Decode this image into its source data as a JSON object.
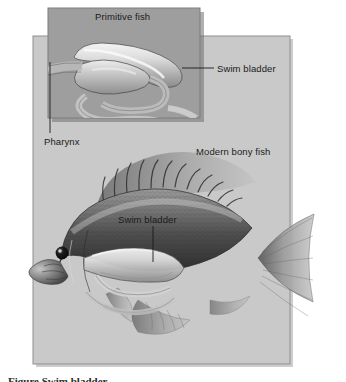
{
  "figure": {
    "kind": "scientific-illustration",
    "palette": {
      "page_background": "#ffffff",
      "main_panel_fill": "#c9c9c9",
      "inset_panel_fill": "#9e9e9e",
      "panel_border": "#8a8a8a",
      "shadow": "#6f6f6f",
      "label_text": "#1a1a1a",
      "leader_line": "#1a1a1a",
      "fish_dark": "#3a3a3a",
      "fish_mid": "#6e6e6e",
      "fish_light": "#cfcfcf",
      "organ_highlight": "#efefef",
      "eye": "#141414"
    }
  },
  "panels": {
    "inset": {
      "name": "primitive-fish-inset",
      "title": "Primitive fish",
      "x": 48,
      "y": 8,
      "width": 152,
      "height": 110
    },
    "main": {
      "name": "modern-bony-fish-panel",
      "title": "Modern bony fish",
      "x": 33,
      "y": 36,
      "width": 257,
      "height": 328
    }
  },
  "labels": {
    "primitive_fish": "Primitive fish",
    "swim_bladder_top": "Swim bladder",
    "pharynx": "Pharynx",
    "modern_bony_fish": "Modern bony fish",
    "swim_bladder_fish": "Swim bladder"
  },
  "leaders": [
    {
      "name": "leader-swim-bladder-top",
      "from": [
        214,
        68
      ],
      "to": [
        182,
        68
      ]
    },
    {
      "name": "leader-pharynx",
      "from": [
        50,
        133
      ],
      "to": [
        50,
        62
      ]
    },
    {
      "name": "leader-swim-bladder-fish",
      "from": [
        153,
        226
      ],
      "to": [
        153,
        262
      ]
    }
  ],
  "caption": {
    "text": "Figure   Swim bladder",
    "note": "cropped at bottom edge"
  }
}
